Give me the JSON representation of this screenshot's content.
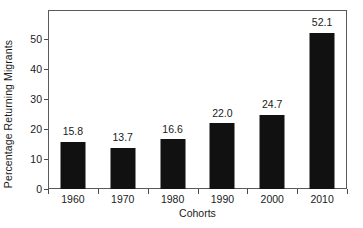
{
  "chart_data": {
    "type": "bar",
    "title": "",
    "xlabel": "Cohorts",
    "ylabel": "Percentage Returning Migrants",
    "categories": [
      "1960",
      "1970",
      "1980",
      "1990",
      "2000",
      "2010"
    ],
    "values": [
      15.8,
      13.7,
      16.6,
      22.0,
      24.7,
      52.1
    ],
    "value_labels": [
      "15.8",
      "13.7",
      "16.6",
      "22.0",
      "24.7",
      "52.1"
    ],
    "ytick_labels": [
      "0",
      "10",
      "20",
      "30",
      "40",
      "50"
    ],
    "ytick_values": [
      0,
      10,
      20,
      30,
      40,
      50
    ],
    "ylim": [
      0,
      59.7
    ],
    "xlim_categories": 6,
    "grid": false,
    "legend": null,
    "bar_color": "#111111",
    "background_color": "#ffffff",
    "axis_color": "#5a5a5a",
    "text_color": "#1a1a1a"
  }
}
